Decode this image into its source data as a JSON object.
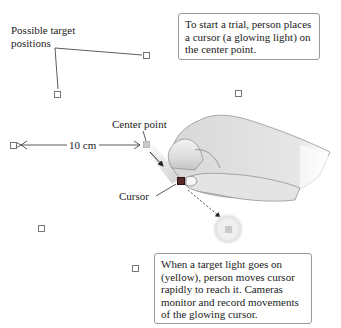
{
  "labels": {
    "possible_targets": [
      "Possible target",
      "positions"
    ],
    "center_point": "Center point",
    "distance": "10 cm",
    "cursor": "Cursor"
  },
  "callouts": {
    "start": "To start a trial, person places a cursor (a glowing light) on the center point.",
    "target": "When a target light goes on (yellow), person moves cursor rapidly to reach it. Cameras monitor and record movements of the glowing cursor."
  },
  "icons": {
    "target_square": "hollow-square",
    "center_point": "gray-square",
    "cursor": "dark-red-square",
    "active_target": "glowing-gray-square"
  },
  "colors": {
    "target_border": "#777777",
    "cursor": "#5a2a2a",
    "glow": "#dddddd",
    "callout_border": "#999999"
  }
}
